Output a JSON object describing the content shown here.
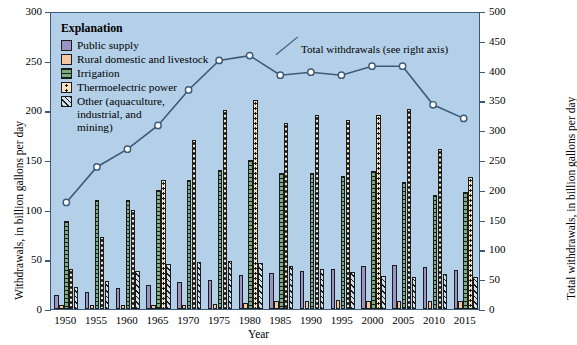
{
  "chart_data": {
    "type": "bar",
    "title": "",
    "xlabel": "Year",
    "ylabel": "Withdrawals, in billion gallons per day",
    "ylabel_right": "Total withdrawals, in billion gallons per day",
    "ylim": [
      0,
      300
    ],
    "ylim_right": [
      0,
      500
    ],
    "yticks": [
      0,
      50,
      100,
      150,
      200,
      250,
      300
    ],
    "yticks_right": [
      0,
      50,
      100,
      150,
      200,
      250,
      300,
      350,
      400,
      450,
      500
    ],
    "grid": false,
    "legend_position": "inside-top-left",
    "legend_title": "Explanation",
    "categories": [
      "1950",
      "1955",
      "1960",
      "1965",
      "1970",
      "1975",
      "1980",
      "1985",
      "1990",
      "1995",
      "2000",
      "2005",
      "2010",
      "2015"
    ],
    "series": [
      {
        "name": "Public supply",
        "key": "public",
        "color": "#9a93c4",
        "axis": "left",
        "values": [
          14,
          17,
          21,
          24,
          27,
          29,
          34,
          36,
          38,
          40,
          43,
          44,
          42,
          39
        ]
      },
      {
        "name": "Rural domestic and livestock",
        "key": "rural",
        "color": "#f2c8a0",
        "axis": "left",
        "values": [
          3.6,
          3.6,
          3.6,
          4,
          4.5,
          4.9,
          5.6,
          7.8,
          7.9,
          8.9,
          8.2,
          8.5,
          8.0,
          8.3
        ]
      },
      {
        "name": "Irrigation",
        "key": "irrigation",
        "color": "#7aae82",
        "axis": "left",
        "values": [
          89,
          110,
          110,
          120,
          130,
          140,
          150,
          137,
          137,
          134,
          139,
          128,
          115,
          118
        ]
      },
      {
        "name": "Thermoelectric power",
        "key": "thermoelectric",
        "color": "#f5e3c3",
        "axis": "left",
        "values": [
          40,
          72,
          100,
          130,
          170,
          200,
          210,
          187,
          195,
          190,
          195,
          201,
          161,
          133
        ]
      },
      {
        "name": "Other (aquaculture, industrial, and mining)",
        "key": "other",
        "color": "#cfe0ee",
        "axis": "left",
        "values": [
          22,
          28,
          38,
          45,
          47,
          48,
          46,
          43,
          40,
          37,
          33,
          32,
          35,
          32
        ]
      }
    ],
    "line_series": {
      "name": "Total withdrawals (see right axis)",
      "axis": "right",
      "color": "#3c5a78",
      "marker": "open-circle",
      "values": [
        180,
        240,
        270,
        310,
        370,
        420,
        428,
        395,
        400,
        395,
        410,
        410,
        345,
        322
      ]
    },
    "annotation": "Total withdrawals (see right axis)"
  },
  "legend": {
    "title": "Explanation",
    "items": [
      {
        "label": "Public supply",
        "swatch": "public"
      },
      {
        "label": "Rural domestic and livestock",
        "swatch": "rural"
      },
      {
        "label": "Irrigation",
        "swatch": "irrigation"
      },
      {
        "label": "Thermoelectric power",
        "swatch": "thermoelectric"
      },
      {
        "label": "Other (aquaculture,\nindustrial, and\nmining)",
        "swatch": "other"
      }
    ]
  },
  "axes": {
    "left_title": "Withdrawals, in billion gallons per day",
    "right_title": "Total withdrawals, in billion gallons per day",
    "x_title": "Year"
  }
}
